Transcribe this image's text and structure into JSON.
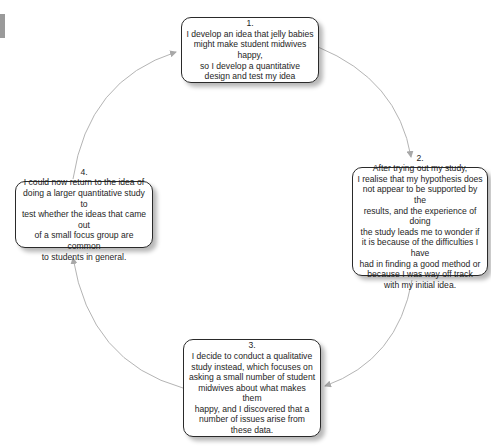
{
  "diagram": {
    "type": "cycle",
    "steps": [
      {
        "number": "1.",
        "text": "I develop an idea that jelly babies\nmight make student midwives happy,\nso I develop a quantitative\ndesign and test my idea"
      },
      {
        "number": "2.",
        "text": "After trying out my study,\nI realise that my hypothesis does\nnot appear to be supported by the\nresults, and the experience of doing\nthe study leads me to wonder if\nit is because of the difficulties I have\nhad in finding a good method or\nbecause I was way off track\nwith my initial idea."
      },
      {
        "number": "3.",
        "text": "I decide to conduct a qualitative\nstudy instead, which focuses on\nasking a small number of student\nmidwives about what makes them\nhappy, and I discovered that a\nnumber of issues arise from\nthese data."
      },
      {
        "number": "4.",
        "text": "I could now return to the idea of\ndoing a larger quantitative study to\ntest whether the ideas that came out\nof a small focus group are common\nto students in general."
      }
    ],
    "connections": [
      {
        "from": "1",
        "to": "2"
      },
      {
        "from": "2",
        "to": "3"
      },
      {
        "from": "3",
        "to": "4"
      },
      {
        "from": "4",
        "to": "1"
      }
    ],
    "colors": {
      "border": "#2a2a2a",
      "arrow": "#b0b0b0",
      "text": "#1e1e1e"
    }
  }
}
